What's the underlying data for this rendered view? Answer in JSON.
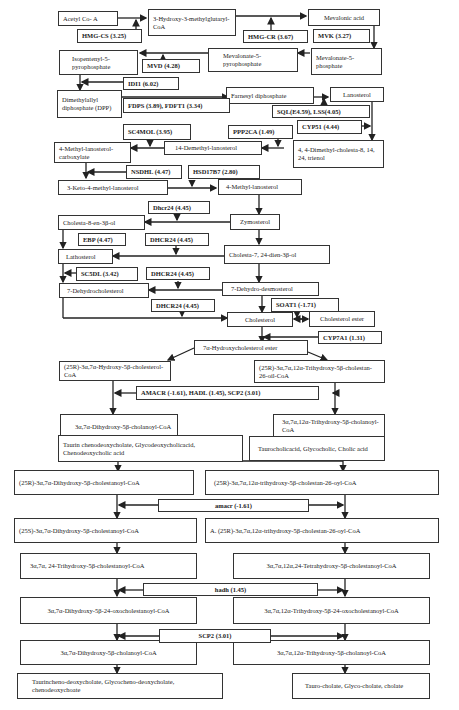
{
  "nodes": {
    "acetyl_coa": "Acetyl Co- A",
    "hmg_coa": "3-Hydroxy-3-methylglutaryl-CoA",
    "mevalonic_acid": "Mevalonic acid",
    "mevalonate_5p": "Mevalonate-5-phosphate",
    "mevalonate_5pp": "Mevalonate-5-pyrophosphate",
    "ipp": "Isopentenyl-5-pyrophosphate",
    "dpp": "Dimethylallyl diphosphate (DPP)",
    "fpp": "Farnesyl diphosphate",
    "lanosterol": "Lanosterol",
    "dimethyl_cholesta": "4, 4-Dimethyl-cholesta-8, 14, 24, trienol",
    "demethyl_14": "14-Demethyl-lanosterol",
    "methyl_lanosterol_carboxylate": "4-Methyl-lanosterol-carboxylate",
    "keto_methyl_lanosterol": "3-Keto-4-methyl-lanosterol",
    "methyl_lanosterol": "4-Methyl-lanosterol",
    "zymosterol": "Zymosterol",
    "cholesta_8_en": "Cholesta-8-en-3β-ol",
    "cholesta_7_24_dien": "Cholesta-7, 24-dien-3β-ol",
    "lathosterol": "Lathosterol",
    "dehydrocholesterol_7": "7-Dehydrocholesterol",
    "dehydro_desmosterol_7": "7-Dehydro-desmosterol",
    "cholesterol": "Cholesterol",
    "cholesterol_ester": "Cholesterol ester",
    "hydroxycholesterol_ester": "7α-Hydroxycholesterol ester",
    "r25_hydroxy_cholesterol_coa": "(25R)-3α,7α-Hydroxy-5β-cholesterol-CoA",
    "r25_trihydroxy_cholestan_26_oil": "(25R)-3α,7α,12α-Trihydroxy-5β-cholestan-26-oil-CoA",
    "dihydroxy_cholanoyl_1": "3α,7α-Dihydroxy-5β-cholanoyl-CoA",
    "trihydroxy_cholanoyl_1": "3α,7α,12α-Trihydroxy-5β-cholanoyl-CoA",
    "taurin_chenodeoxycholate": "Taurin chenodeoxycholate, Glycodeoxycholicacid, Chenodeoxycholic acid",
    "taurocholic": "Taurocholicacid, Glycocholic, Cholic acid",
    "r25_dihydroxy_cholestanoyl": "(25R)-3α,7α-Dihydroxy-5β-cholestanoyl-CoA",
    "r25_trihydroxy_cholestan_26_oyl": "(25R)-3α,7α,12α-trihydroxy-5β-cholestan-26-oyl-CoA",
    "s25_dihydroxy_cholestanoyl": "(25S)-3α,7α-Dihydroxy-5β-cholestanoyl-CoA",
    "a_r25_trihydroxy": "A. (25R)-3α,7α,12α-trihydroxy-5β-cholestan-26-oyl-CoA",
    "trihydroxy_24_cholestanoyl": "3α,7α, 24-Trihydroxy-5β-cholestanoyl-CoA",
    "tetrahydroxy_cholestanoyl": "3α,7α,12α,24-Tetrahydroxy-5β-cholestanoyl-CoA",
    "dihydroxy_24_oxo": "3α,7α-Dihydroxy-5β-24-oxocholestanoyl-CoA",
    "trihydroxy_24_oxo": "3α,7α,12α-Trihydroxy-5β-24-oxocholestanoyl-CoA",
    "dihydroxy_cholanoyl_2": "3α,7α-Dihydroxy-5β-cholanoyl-CoA",
    "trihydroxy_cholanoyl_2": "3α,7α,12α-Trihydroxy-5β-cholanoyl-CoA",
    "taurocheno_final": "Taurincheno-deoxycholate, Glycocheno-deoxycholate, chenodeoxychoate",
    "tauro_cholate_final": "Tauro-cholate, Glyco-cholate, cholate"
  },
  "enzymes": {
    "hmgcs": "HMG-CS (3.25)",
    "hmgcr": "HMG-CR (3.67)",
    "mvk": "MVK (3.27)",
    "mvd": "MVD (4.28)",
    "idi1": "IDI1 (6.02)",
    "fdps": "FDPS (3.89), FDFT1 (3.34)",
    "sql_lss": "SQL(E4.59), LSS(4.05)",
    "cyp51": "CYP51 (4.44)",
    "sc4mol": "SC4MOL (3.95)",
    "ppp2ca": "PPP2CA (1.49)",
    "nsdhl": "NSDHL (4.47)",
    "hsd17b7": "HSD17B7 (2.80)",
    "dhcr24_a": "Dhcr24 (4.45)",
    "ebp": "EBP (4.47)",
    "dhcr24_b": "DHCR24 (4.45)",
    "sc5dl": "SC5DL (3.42)",
    "dhcr24_c": "DHCR24 (4.45)",
    "dhcr24_d": "DHCR24 (4.45)",
    "soat1": "SOAT1 (-1.71)",
    "cyp7a1": "CYP7A1 (1.31)",
    "amacr_hadl_scp2": "AMACR (-1.61), HADL (1.45), SCP2 (3.01)",
    "amacr": "amacr (-1.61)",
    "hadh": "hadh (1.45)",
    "scp2": "SCP2 (3.01)"
  }
}
